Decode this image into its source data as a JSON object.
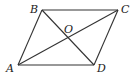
{
  "diagram": {
    "type": "parallelogram-with-diagonals",
    "points": {
      "A": {
        "label": "A",
        "x": 18,
        "y": 65
      },
      "B": {
        "label": "B",
        "x": 42,
        "y": 10
      },
      "C": {
        "label": "C",
        "x": 118,
        "y": 10
      },
      "D": {
        "label": "D",
        "x": 94,
        "y": 65
      },
      "O": {
        "label": "O",
        "x": 68,
        "y": 37.5
      }
    },
    "segments": [
      "AB",
      "BC",
      "CD",
      "DA",
      "AC",
      "BD"
    ],
    "labels": {
      "A": "A",
      "B": "B",
      "C": "C",
      "D": "D",
      "O": "O"
    },
    "colors": {
      "stroke": "#333333",
      "text": "#222222"
    }
  }
}
